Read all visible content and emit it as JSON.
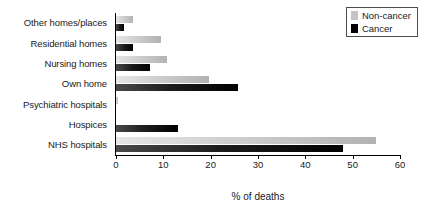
{
  "chart_data": {
    "type": "bar",
    "orientation": "horizontal",
    "title": "",
    "xlabel": "% of deaths",
    "ylabel": "",
    "xlim": [
      0,
      60
    ],
    "xticks": [
      0,
      10,
      20,
      30,
      40,
      50,
      60
    ],
    "grid": false,
    "legend_position": "top-right",
    "categories": [
      "Other homes/places",
      "Residential homes",
      "Nursing homes",
      "Own home",
      "Psychiatric hospitals",
      "Hospices",
      "NHS hospitals"
    ],
    "series": [
      {
        "name": "Non-cancer",
        "color": "#c4c4c4",
        "values": [
          3.5,
          9.5,
          10.8,
          19.7,
          0.5,
          0.1,
          55.0
        ]
      },
      {
        "name": "Cancer",
        "color": "#000000",
        "values": [
          1.7,
          3.5,
          7.2,
          25.8,
          0.1,
          13.2,
          48.0
        ]
      }
    ]
  },
  "legend": {
    "items": [
      {
        "label": "Non-cancer"
      },
      {
        "label": "Cancer"
      }
    ]
  }
}
